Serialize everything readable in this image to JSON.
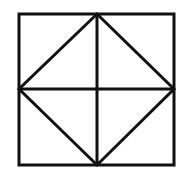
{
  "diagram": {
    "background": "#ffffff",
    "stroke_color": "#111111",
    "stroke_width": 3,
    "outer_square": {
      "x1": 19,
      "y1": 14,
      "x2": 174,
      "y2": 165
    },
    "points": {
      "top_mid": [
        97,
        14
      ],
      "right_mid": [
        174,
        89
      ],
      "bottom_mid": [
        97,
        165
      ],
      "left_mid": [
        19,
        89
      ],
      "center": [
        97,
        89
      ]
    },
    "shapes": [
      {
        "name": "outer-square",
        "type": "rect"
      },
      {
        "name": "inscribed-diamond",
        "type": "polygon",
        "vertices": [
          "top_mid",
          "right_mid",
          "bottom_mid",
          "left_mid"
        ]
      },
      {
        "name": "vertical-midline",
        "type": "line",
        "from": "top_mid",
        "to": "bottom_mid"
      },
      {
        "name": "horizontal-midline",
        "type": "line",
        "from": "left_mid",
        "to": "right_mid"
      }
    ]
  }
}
